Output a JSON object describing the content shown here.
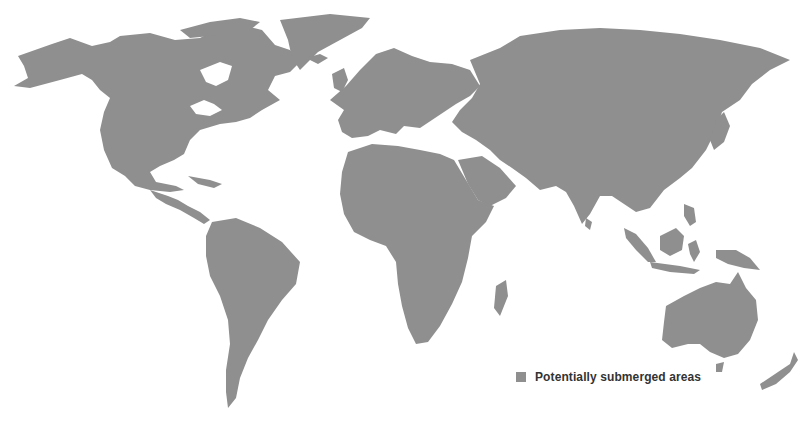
{
  "map": {
    "fill_color": "#8f8f8f",
    "background_color": "#ffffff",
    "projection": "world map (Robinson-like)",
    "legend": {
      "items": [
        {
          "label": "Potentially submerged areas",
          "color": "#8f8f8f"
        }
      ]
    }
  }
}
